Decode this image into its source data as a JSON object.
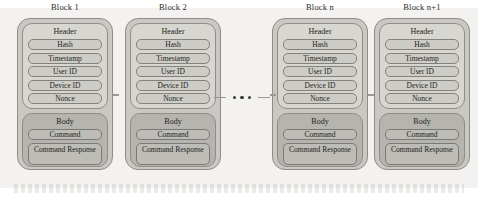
{
  "diagram": {
    "colors": {
      "page_tint": "#e9e8e4",
      "block_shell": "#c9c8c3",
      "header_panel": "#d7d6d1",
      "body_panel": "#b5b4af",
      "field_fill": "#cdccc7",
      "outline": "#8e8d88",
      "text": "#242422",
      "dot": "#3a3a38"
    },
    "blocks": [
      {
        "title": "Block 1",
        "header": {
          "label": "Header",
          "fields": [
            "Hash",
            "Timestamp",
            "User ID",
            "Device ID",
            "Nonce"
          ]
        },
        "body": {
          "label": "Body",
          "fields": [
            "Command",
            "Command Response"
          ]
        }
      },
      {
        "title": "Block 2",
        "header": {
          "label": "Header",
          "fields": [
            "Hash",
            "Timestamp",
            "User ID",
            "Device ID",
            "Nonce"
          ]
        },
        "body": {
          "label": "Body",
          "fields": [
            "Command",
            "Command Response"
          ]
        }
      },
      {
        "title": "Block n",
        "header": {
          "label": "Header",
          "fields": [
            "Hash",
            "Timestamp",
            "User ID",
            "Device ID",
            "Nonce"
          ]
        },
        "body": {
          "label": "Body",
          "fields": [
            "Command",
            "Command Response"
          ]
        }
      },
      {
        "title": "Block n+1",
        "header": {
          "label": "Header",
          "fields": [
            "Hash",
            "Timestamp",
            "User ID",
            "Device ID",
            "Nonce"
          ]
        },
        "body": {
          "label": "Body",
          "fields": [
            "Command",
            "Command Response"
          ]
        }
      }
    ],
    "connector": {
      "dot_count": 3,
      "meaning": "ellipsis-continuation"
    }
  }
}
